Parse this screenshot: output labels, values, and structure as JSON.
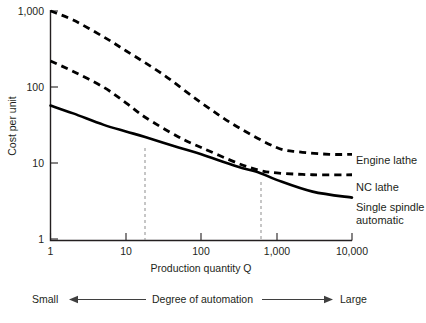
{
  "chart_data": {
    "type": "line",
    "title": "",
    "xlabel": "Production quantity Q",
    "ylabel": "Cost per unit",
    "xscale": "log",
    "yscale": "log",
    "xlim": [
      1,
      10000
    ],
    "ylim": [
      1,
      1000
    ],
    "grid": false,
    "legend_position": "right",
    "x_ticks": [
      "1",
      "10",
      "100",
      "1,000",
      "10,000"
    ],
    "x_tick_values": [
      1,
      10,
      100,
      1000,
      10000
    ],
    "y_ticks": [
      "1",
      "10",
      "100",
      "1,000"
    ],
    "y_tick_values": [
      1,
      10,
      100,
      1000
    ],
    "series": [
      {
        "name": "Engine lathe",
        "style": "dashed",
        "x": [
          1,
          2,
          5,
          10,
          30,
          100,
          300,
          1000,
          2000,
          5000,
          10000
        ],
        "y": [
          1000,
          760,
          460,
          300,
          150,
          62,
          30,
          16,
          14,
          13,
          13
        ]
      },
      {
        "name": "NC lathe",
        "style": "dashed",
        "x": [
          1,
          2,
          5,
          10,
          18,
          50,
          100,
          300,
          600,
          1000,
          3000,
          10000
        ],
        "y": [
          220,
          160,
          100,
          62,
          40,
          22,
          16,
          10,
          8,
          7.4,
          7,
          7
        ]
      },
      {
        "name": "Single spindle automatic",
        "style": "solid",
        "x": [
          1,
          2,
          5,
          10,
          18,
          50,
          100,
          300,
          600,
          1000,
          3000,
          10000
        ],
        "y": [
          57,
          45,
          32,
          26,
          22,
          16,
          13,
          9,
          7.4,
          6,
          4.2,
          3.5
        ]
      }
    ],
    "annotations": [
      {
        "name": "breakeven-engine-nc",
        "x": 18,
        "label": ""
      },
      {
        "name": "breakeven-nc-single",
        "x": 600,
        "label": ""
      }
    ]
  },
  "legend": {
    "items": [
      {
        "label": "Engine lathe"
      },
      {
        "label": "NC lathe"
      },
      {
        "label": "Single spindle"
      },
      {
        "label": "automatic"
      }
    ]
  },
  "footer": {
    "left_label": "Small",
    "center_label": "Degree of automation",
    "right_label": "Large"
  }
}
